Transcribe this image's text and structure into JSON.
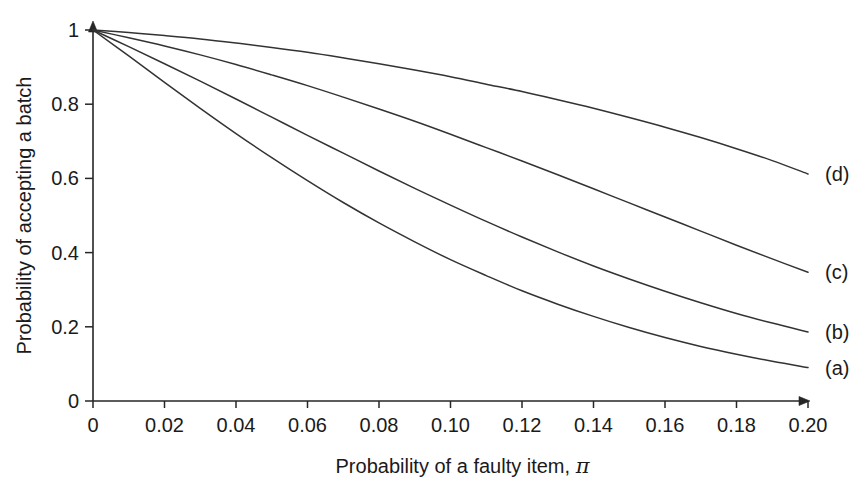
{
  "chart_data": {
    "type": "line",
    "title": "",
    "xlabel": "Probability of a faulty item, π",
    "ylabel": "Probability of accepting a batch",
    "xlim": [
      0,
      0.2
    ],
    "ylim": [
      0,
      1
    ],
    "grid": false,
    "legend_position": "right-inline-end-of-curve",
    "x_ticks": [
      "0",
      "0.02",
      "0.04",
      "0.06",
      "0.08",
      "0.10",
      "0.12",
      "0.14",
      "0.16",
      "0.18",
      "0.20"
    ],
    "x_tick_values": [
      0,
      0.02,
      0.04,
      0.06,
      0.08,
      0.1,
      0.12,
      0.14,
      0.16,
      0.18,
      0.2
    ],
    "y_ticks": [
      "0",
      "0.2",
      "0.4",
      "0.6",
      "0.8",
      "1"
    ],
    "y_tick_values": [
      0,
      0.2,
      0.4,
      0.6,
      0.8,
      1
    ],
    "x": [
      0,
      0.01,
      0.02,
      0.03,
      0.04,
      0.05,
      0.06,
      0.07,
      0.08,
      0.09,
      0.1,
      0.11,
      0.12,
      0.13,
      0.14,
      0.15,
      0.16,
      0.17,
      0.18,
      0.19,
      0.2
    ],
    "series": [
      {
        "name": "(d)",
        "label": "(d)",
        "values": [
          1.0,
          0.993,
          0.985,
          0.976,
          0.965,
          0.953,
          0.94,
          0.925,
          0.909,
          0.892,
          0.874,
          0.854,
          0.834,
          0.812,
          0.789,
          0.764,
          0.738,
          0.71,
          0.68,
          0.648,
          0.612
        ]
      },
      {
        "name": "(c)",
        "label": "(c)",
        "values": [
          1.0,
          0.979,
          0.957,
          0.933,
          0.907,
          0.879,
          0.85,
          0.819,
          0.787,
          0.754,
          0.719,
          0.683,
          0.647,
          0.61,
          0.572,
          0.534,
          0.496,
          0.458,
          0.42,
          0.383,
          0.347
        ]
      },
      {
        "name": "(b)",
        "label": "(b)",
        "values": [
          1.0,
          0.955,
          0.909,
          0.862,
          0.814,
          0.765,
          0.716,
          0.668,
          0.62,
          0.573,
          0.528,
          0.484,
          0.442,
          0.402,
          0.364,
          0.329,
          0.296,
          0.265,
          0.236,
          0.21,
          0.186
        ]
      },
      {
        "name": "(a)",
        "label": "(a)",
        "values": [
          1.0,
          0.93,
          0.859,
          0.789,
          0.721,
          0.656,
          0.594,
          0.535,
          0.48,
          0.429,
          0.381,
          0.338,
          0.297,
          0.261,
          0.228,
          0.198,
          0.171,
          0.147,
          0.126,
          0.107,
          0.09
        ]
      }
    ]
  },
  "axes": {
    "x_axis_name": "x-axis",
    "y_axis_name": "y-axis",
    "arrow_x": "x-axis-arrow",
    "arrow_y": "y-axis-arrow"
  },
  "style": {
    "background": "#ffffff",
    "curve_color": "#333333",
    "axis_color": "#262626",
    "text_color": "#1a1a1a"
  }
}
